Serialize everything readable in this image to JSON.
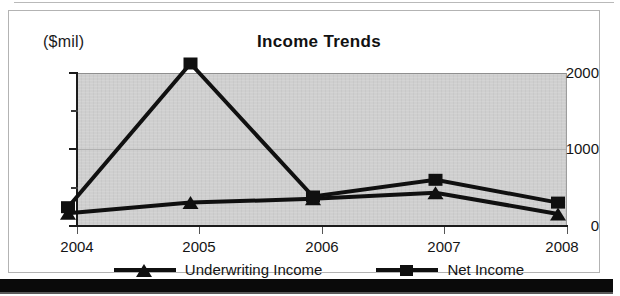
{
  "chart_data": {
    "type": "line",
    "title": "Income Trends",
    "xlabel": "",
    "ylabel": "($mil)",
    "categories": [
      "2004",
      "2005",
      "2006",
      "2007",
      "2008"
    ],
    "ylim": [
      0,
      2000
    ],
    "yticks": [
      0,
      1000,
      2000
    ],
    "ytick_labels": [
      "0",
      "1000",
      "2000"
    ],
    "yminor_ticks": [
      500,
      1500
    ],
    "grid": true,
    "legend_position": "bottom",
    "series": [
      {
        "name": "Underwriting Income",
        "marker": "triangle",
        "color": "#101010",
        "values": [
          10,
          150,
          200,
          280,
          0
        ]
      },
      {
        "name": "Net Income",
        "marker": "square",
        "color": "#101010",
        "values": [
          90,
          1980,
          230,
          450,
          150
        ]
      }
    ]
  },
  "axis": {
    "unit_label": "($mil)",
    "y_labels": [
      "2000",
      "1000",
      "0"
    ],
    "x_labels": [
      "2004",
      "2005",
      "2006",
      "2007",
      "2008"
    ]
  },
  "legend": {
    "entries": [
      {
        "label": "Underwriting Income",
        "marker": "triangle-marker"
      },
      {
        "label": "Net Income",
        "marker": "square-marker"
      }
    ]
  }
}
